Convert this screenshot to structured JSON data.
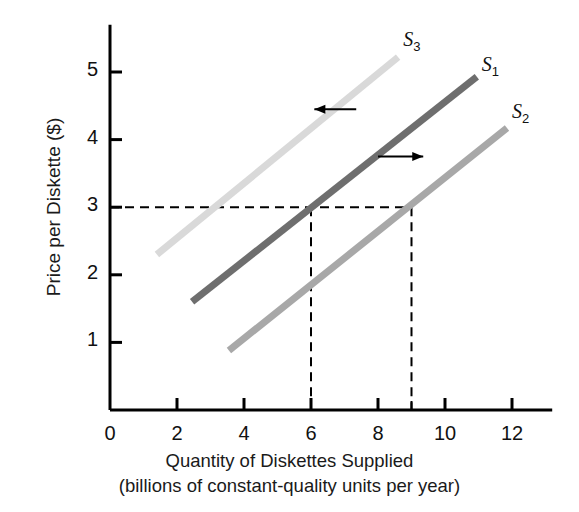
{
  "chart_data": {
    "type": "line",
    "title": "",
    "xlabel": "Quantity of Diskettes Supplied",
    "xlabel_line2": "(billions of constant-quality units per year)",
    "ylabel": "Price per Diskette ($)",
    "xlim": [
      0,
      13.2
    ],
    "ylim": [
      0,
      5.7
    ],
    "xticks": [
      0,
      2,
      4,
      6,
      8,
      10,
      12
    ],
    "xticklabels": [
      "0",
      "2",
      "4",
      "6",
      "8",
      "10",
      "12"
    ],
    "yticks": [
      1,
      2,
      3,
      4,
      5
    ],
    "yticklabels": [
      "1",
      "2",
      "3",
      "4",
      "5"
    ],
    "minor_xticks": [
      9
    ],
    "grid": false,
    "legend": "inline-curve-labels",
    "series": [
      {
        "name": "S3",
        "label": "S",
        "sub": "3",
        "color": "#d9d9d9",
        "x": [
          1.4,
          8.6
        ],
        "y": [
          2.3,
          5.22
        ],
        "label_x": 8.75,
        "label_y": 5.45
      },
      {
        "name": "S1",
        "label": "S",
        "sub": "1",
        "color": "#6e6e6e",
        "x": [
          2.45,
          10.95
        ],
        "y": [
          1.6,
          4.93
        ],
        "label_x": 11.1,
        "label_y": 5.08
      },
      {
        "name": "S2",
        "label": "S",
        "sub": "2",
        "color": "#a8a8a8",
        "x": [
          3.55,
          11.85
        ],
        "y": [
          0.88,
          4.17
        ],
        "label_x": 12.0,
        "label_y": 4.38
      }
    ],
    "guides": {
      "price_level": 3,
      "horizontal_dashed_from_x": 0,
      "horizontal_dashed_to_x": 9,
      "vertical_dashed_x": [
        6,
        9
      ],
      "vertical_dashed_top_y": 3
    },
    "annotations": [
      {
        "name": "leftward-shift-arrow",
        "direction": "left",
        "x_start": 7.35,
        "x_end": 6.1,
        "y": 4.45
      },
      {
        "name": "rightward-shift-arrow",
        "direction": "right",
        "x_start": 8.0,
        "x_end": 9.35,
        "y": 3.75
      }
    ]
  }
}
